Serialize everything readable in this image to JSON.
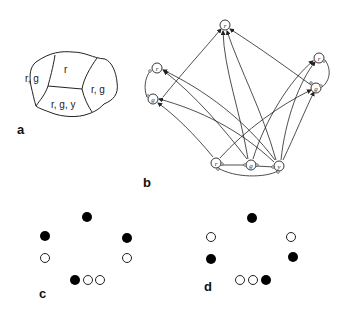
{
  "panels": {
    "a": {
      "label": "a",
      "regions": [
        {
          "id": "left",
          "label": "r, g"
        },
        {
          "id": "top",
          "label": "r"
        },
        {
          "id": "right",
          "label": "r, g"
        },
        {
          "id": "bottom",
          "label": "r, g, y"
        }
      ]
    },
    "b": {
      "label": "b",
      "nodes": [
        {
          "id": "top-r",
          "label": "r"
        },
        {
          "id": "left-r",
          "label": "r"
        },
        {
          "id": "left-g",
          "label": "g"
        },
        {
          "id": "right-r",
          "label": "r"
        },
        {
          "id": "right-g",
          "label": "g"
        },
        {
          "id": "bottom-r",
          "label": "r"
        },
        {
          "id": "bottom-g",
          "label": "g"
        },
        {
          "id": "bottom-y",
          "label": "y"
        }
      ]
    },
    "c": {
      "label": "c",
      "dots": [
        "filled",
        "filled",
        "filled",
        "open",
        "open",
        "filled",
        "open",
        "open"
      ]
    },
    "d": {
      "label": "d",
      "dots": [
        "filled",
        "open",
        "open",
        "filled",
        "filled",
        "open",
        "open",
        "filled"
      ]
    }
  },
  "colors": {
    "ink": "#222222",
    "filled": "#000000",
    "background": "#ffffff"
  }
}
